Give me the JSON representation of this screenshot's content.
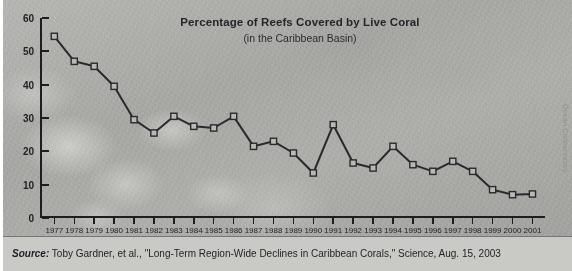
{
  "chart_data": {
    "type": "line",
    "title": "Percentage of Reefs Covered by Live Coral",
    "subtitle": "(in the Caribbean Basin)",
    "xlabel": "",
    "ylabel": "",
    "ylim": [
      0,
      60
    ],
    "yticks": [
      0,
      10,
      20,
      30,
      40,
      50,
      60
    ],
    "grid": false,
    "legend": "none",
    "categories": [
      "1977",
      "1978",
      "1979",
      "1980",
      "1981",
      "1982",
      "1983",
      "1984",
      "1985",
      "1986",
      "1987",
      "1988",
      "1989",
      "1990",
      "1991",
      "1992",
      "1993",
      "1994",
      "1995",
      "1996",
      "1997",
      "1998",
      "1999",
      "2000",
      "2001"
    ],
    "values": [
      54.5,
      47,
      45.5,
      39.5,
      29.5,
      25.5,
      30.5,
      27.5,
      27,
      30.5,
      21.5,
      23,
      19.5,
      13.5,
      28,
      16.5,
      15,
      21.5,
      16,
      14,
      17,
      14,
      8.5,
      7,
      7.2
    ],
    "series": [
      {
        "name": "Percentage of reefs covered by live coral",
        "values": [
          54.5,
          47,
          45.5,
          39.5,
          29.5,
          25.5,
          30.5,
          27.5,
          27,
          30.5,
          21.5,
          23,
          19.5,
          13.5,
          28,
          16.5,
          15,
          21.5,
          16,
          14,
          17,
          14,
          8.5,
          7,
          7.2
        ]
      }
    ],
    "marker": "square",
    "line_color": "#2a2a2e",
    "marker_fill": "#b9b9b5",
    "marker_stroke": "#2a2a2e"
  },
  "credit": {
    "vertical_text": "Ocean Conservancy"
  },
  "source": {
    "label": "Source:",
    "text": "Toby Gardner, et al., \"Long-Term Region-Wide Declines in Caribbean Corals,\" Science, Aug. 15, 2003"
  }
}
